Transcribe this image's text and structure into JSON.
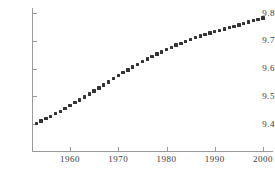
{
  "chart_data": {
    "type": "scatter",
    "title": "",
    "xlabel": "",
    "ylabel": "",
    "xlim": [
      1952,
      2001
    ],
    "ylim": [
      9.38,
      9.815
    ],
    "grid": false,
    "legend": null,
    "marker": {
      "shape": "square",
      "color": "#333333",
      "size_px": 3.4
    },
    "axis_color": "#9a9a9a",
    "x_ticks": [
      1960,
      1970,
      1980,
      1990,
      2000
    ],
    "x_tick_labels": [
      "1960",
      "1970",
      "1980",
      "1990",
      "2000"
    ],
    "y_ticks": [
      9.4,
      9.5,
      9.6,
      9.7,
      9.8
    ],
    "y_tick_labels": [
      "9.4",
      "9.5",
      "9.6",
      "9.7",
      "9.8"
    ],
    "x": [
      1953,
      1954,
      1955,
      1956,
      1957,
      1958,
      1959,
      1960,
      1961,
      1962,
      1963,
      1964,
      1965,
      1966,
      1967,
      1968,
      1969,
      1970,
      1971,
      1972,
      1973,
      1974,
      1975,
      1976,
      1977,
      1978,
      1979,
      1980,
      1981,
      1982,
      1983,
      1984,
      1985,
      1986,
      1987,
      1988,
      1989,
      1990,
      1991,
      1992,
      1993,
      1994,
      1995,
      1996,
      1997,
      1998,
      1999,
      2000
    ],
    "y": [
      9.402,
      9.411,
      9.419,
      9.428,
      9.437,
      9.446,
      9.456,
      9.467,
      9.477,
      9.487,
      9.497,
      9.508,
      9.519,
      9.53,
      9.541,
      9.552,
      9.563,
      9.574,
      9.585,
      9.595,
      9.605,
      9.615,
      9.625,
      9.634,
      9.643,
      9.652,
      9.66,
      9.668,
      9.676,
      9.684,
      9.691,
      9.698,
      9.705,
      9.711,
      9.717,
      9.723,
      9.728,
      9.733,
      9.738,
      9.743,
      9.748,
      9.752,
      9.757,
      9.762,
      9.767,
      9.772,
      9.777,
      9.782
    ]
  }
}
